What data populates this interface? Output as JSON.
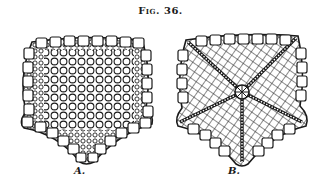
{
  "figure": {
    "title": "Fig. 36.",
    "panels": [
      {
        "id": "A",
        "label": "A.",
        "description": "starfish skeleton, dorsal view with polygonal plates"
      },
      {
        "id": "B",
        "label": "B.",
        "description": "starfish skeleton, ventral view with ambulacral grooves radiating from mouth"
      }
    ]
  },
  "colors": {
    "ink": "#1a1a1a",
    "paper": "#ffffff"
  }
}
